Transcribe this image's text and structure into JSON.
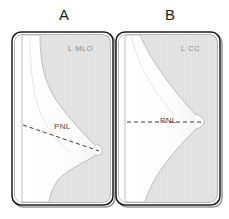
{
  "figure": {
    "type": "diagram",
    "background_color": "#ffffff",
    "panels": [
      {
        "letter": "A",
        "view_label": "L MLO",
        "view_full_name": "Left Mediolateral Oblique",
        "pnl_label": "PNL",
        "pnl_orientation": "oblique-descending",
        "frame": {
          "x": 12,
          "y": 32,
          "width": 101,
          "height": 173,
          "corner_radius": 9
        }
      },
      {
        "letter": "B",
        "view_label": "L CC",
        "view_full_name": "Left Craniocaudal",
        "pnl_label": "PNL",
        "pnl_orientation": "horizontal",
        "frame": {
          "x": 116,
          "y": 32,
          "width": 104,
          "height": 173,
          "corner_radius": 9
        }
      }
    ],
    "colors": {
      "frame_stroke": "#1c1c1c",
      "frame_fill": "#ffffff",
      "field_gray": "#e2e2e2",
      "breast_fill": "#fbfbfb",
      "breast_stroke": "#b8b8b8",
      "pnl_line": "#3a3a3a",
      "letter_text": "#1c1c1c",
      "view_label_text": "#8d8d8d",
      "pnl_label_text": "#4a4a4a",
      "shadow": "#9a9a9a"
    }
  }
}
